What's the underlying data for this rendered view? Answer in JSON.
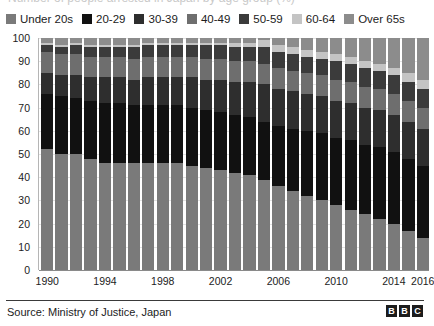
{
  "title_cut": "Number of people arrested in Japan by age group (%)",
  "legend": {
    "items": [
      {
        "label": "Under 20s",
        "color": "#7a7a7a"
      },
      {
        "label": "20-29",
        "color": "#111111"
      },
      {
        "label": "30-39",
        "color": "#2e2e2e"
      },
      {
        "label": "40-49",
        "color": "#6e6e6e"
      },
      {
        "label": "50-59",
        "color": "#3b3b3b"
      },
      {
        "label": "60-64",
        "color": "#c4c4c4"
      },
      {
        "label": "Over 65s",
        "color": "#8c8c8c"
      }
    ]
  },
  "source": {
    "text": "Source: Ministry of Justice, Japan"
  },
  "brand": {
    "blocks": [
      "B",
      "B",
      "C"
    ]
  },
  "chart_data": {
    "type": "bar",
    "stacked": true,
    "normalized_percent": true,
    "title": "Number of people arrested in Japan by age group (%)",
    "xlabel": "",
    "ylabel": "",
    "ylim": [
      0,
      100
    ],
    "yticks": [
      0,
      10,
      20,
      30,
      40,
      50,
      60,
      70,
      80,
      90,
      100
    ],
    "grid": true,
    "legend_position": "top",
    "categories": [
      "1990",
      "1991",
      "1992",
      "1993",
      "1994",
      "1995",
      "1996",
      "1997",
      "1998",
      "1999",
      "2000",
      "2001",
      "2002",
      "2003",
      "2004",
      "2005",
      "2006",
      "2007",
      "2008",
      "2009",
      "2010",
      "2011",
      "2012",
      "2013",
      "2014",
      "2015",
      "2016"
    ],
    "xtick_labels": [
      "1990",
      "1994",
      "1998",
      "2002",
      "2006",
      "2010",
      "2014",
      "2016"
    ],
    "xtick_indices": [
      0,
      4,
      8,
      12,
      16,
      20,
      24,
      26
    ],
    "series": [
      {
        "name": "Under 20s",
        "color": "#7a7a7a",
        "values": [
          52,
          50,
          50,
          48,
          46,
          46,
          46,
          46,
          46,
          46,
          45,
          44,
          43,
          42,
          41,
          39,
          36,
          34,
          32,
          30,
          28,
          26,
          24,
          22,
          20,
          17,
          14
        ]
      },
      {
        "name": "20-29",
        "color": "#111111",
        "values": [
          24,
          25,
          24,
          25,
          26,
          26,
          25,
          25,
          25,
          25,
          25,
          25,
          25,
          25,
          25,
          25,
          26,
          27,
          28,
          29,
          29,
          30,
          30,
          31,
          31,
          31,
          31
        ]
      },
      {
        "name": "30-39",
        "color": "#2e2e2e",
        "values": [
          9,
          9,
          10,
          10,
          11,
          11,
          11,
          12,
          12,
          12,
          13,
          13,
          14,
          14,
          15,
          16,
          16,
          16,
          16,
          16,
          16,
          16,
          16,
          16,
          16,
          16,
          16
        ]
      },
      {
        "name": "40-49",
        "color": "#6e6e6e",
        "values": [
          9,
          9,
          9,
          9,
          9,
          9,
          9,
          9,
          9,
          9,
          9,
          9,
          9,
          9,
          9,
          9,
          9,
          9,
          9,
          9,
          9,
          9,
          9,
          9,
          9,
          9,
          9
        ]
      },
      {
        "name": "50-59",
        "color": "#3b3b3b",
        "values": [
          3,
          3,
          4,
          4,
          4,
          4,
          5,
          5,
          5,
          5,
          5,
          6,
          6,
          6,
          6,
          7,
          7,
          7,
          7,
          7,
          8,
          8,
          8,
          8,
          8,
          8,
          8
        ]
      },
      {
        "name": "60-64",
        "color": "#c4c4c4",
        "values": [
          1,
          1,
          1,
          1,
          1,
          1,
          1,
          1,
          1,
          1,
          1,
          1,
          1,
          2,
          2,
          3,
          3,
          3,
          3,
          3,
          3,
          3,
          3,
          3,
          3,
          4,
          4
        ]
      },
      {
        "name": "Over 65s",
        "color": "#8c8c8c",
        "values": [
          2,
          3,
          2,
          3,
          3,
          3,
          3,
          2,
          2,
          2,
          2,
          2,
          2,
          2,
          2,
          1,
          3,
          4,
          5,
          6,
          7,
          8,
          10,
          11,
          13,
          15,
          18
        ]
      }
    ]
  }
}
